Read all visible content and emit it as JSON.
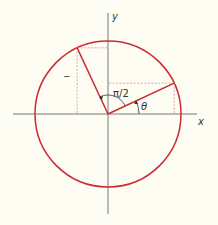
{
  "diagram": {
    "labels": {
      "x_axis": "x",
      "y_axis": "y",
      "theta": "θ",
      "right_angle": "π/2",
      "minus_mark": "−"
    },
    "angle_theta_deg": 25,
    "rotation_deg": 90,
    "colors": {
      "circle": "#cc2a32",
      "vectors": "#cc2a32",
      "projections": "#e08a8f",
      "axes": "#555555",
      "background": "#fdfdf3"
    }
  }
}
